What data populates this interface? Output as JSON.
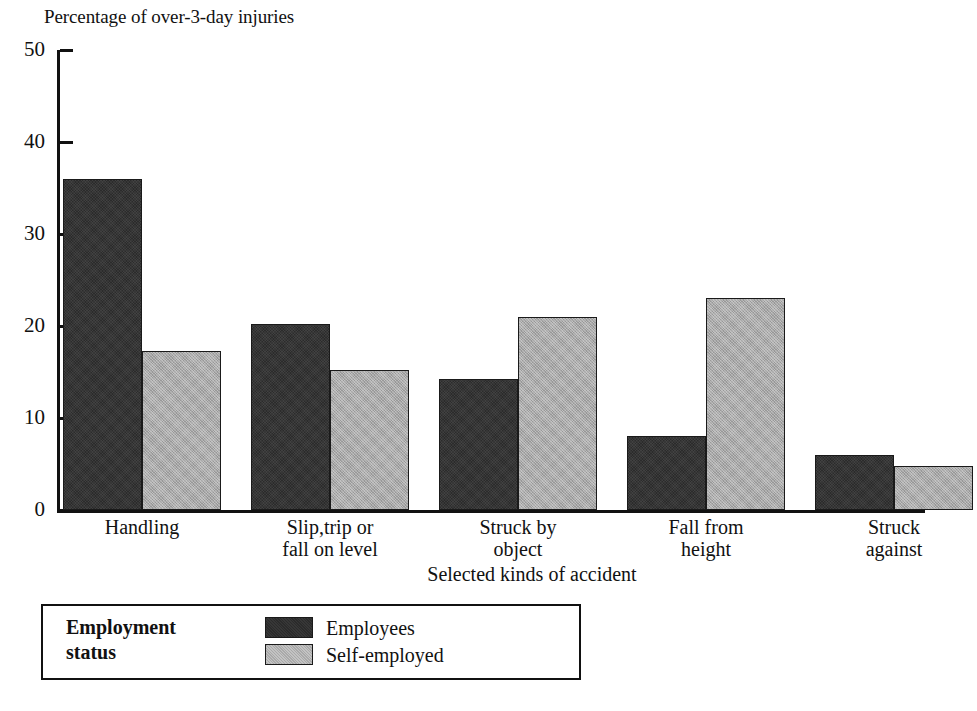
{
  "chart_data": {
    "type": "bar",
    "title": "",
    "ylabel": "Percentage of over-3-day injuries",
    "xlabel": "Selected kinds of accident",
    "categories": [
      "Handling",
      "Slip,trip or\nfall on level",
      "Struck by\nobject",
      "Fall from\nheight",
      "Struck\nagainst"
    ],
    "series": [
      {
        "name": "Employees",
        "color": "#2b2b2b",
        "values": [
          36,
          20.2,
          14.2,
          8,
          6
        ]
      },
      {
        "name": "Self-employed",
        "color": "#a9a9a9",
        "values": [
          17.3,
          15.2,
          21,
          23,
          4.8
        ]
      }
    ],
    "ylim": [
      0,
      50
    ],
    "yticks": [
      0,
      10,
      20,
      30,
      40,
      50
    ],
    "ytick_labels": [
      "0",
      "10",
      "20",
      "30",
      "40",
      "50"
    ],
    "grid": false,
    "legend_position": "below-plot-left",
    "legend_title": "Employment\nstatus"
  },
  "axes": {
    "y_title": "Percentage of over-3-day injuries",
    "x_title": "Selected kinds of accident"
  },
  "legend": {
    "title": "Employment\nstatus",
    "entries": [
      {
        "label": "Employees"
      },
      {
        "label": "Self-employed"
      }
    ]
  }
}
